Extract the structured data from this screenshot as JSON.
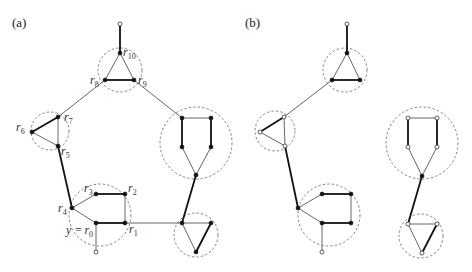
{
  "panels": {
    "a": {
      "label": "(a)",
      "vertex_labels": {
        "r0": "y = r0",
        "r1": "r1",
        "r2": "r2",
        "r3": "r3",
        "r4": "r4",
        "r5": "r5",
        "r6": "r6",
        "r7": "r7",
        "r8": "r8",
        "r9": "r9",
        "r10": "r10"
      },
      "labels_parts": {
        "y_eq": "y =",
        "r": "r",
        "s0": "0",
        "s1": "1",
        "s2": "2",
        "s3": "3",
        "s4": "4",
        "s5": "5",
        "s6": "6",
        "s7": "7",
        "s8": "8",
        "s9": "9",
        "s10": "10"
      }
    },
    "b": {
      "label": "(b)"
    }
  },
  "legend": {
    "filled_vertex": "filled-black-dot",
    "open_vertex": "open-white-dot",
    "cluster": "dashed-circle"
  }
}
